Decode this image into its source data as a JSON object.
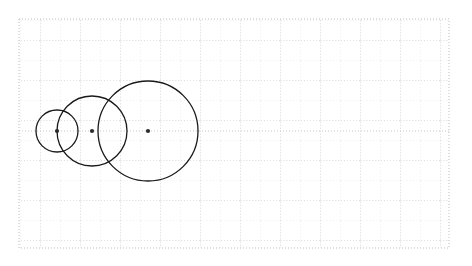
{
  "figure": {
    "title": "Three mutually tangent circles on a dotted grid",
    "width": 472,
    "height": 266,
    "background_color": "#ffffff"
  },
  "grid": {
    "x": 19,
    "y": 19,
    "width": 430,
    "height": 229,
    "minor_spacing": 20,
    "major_spacing": 40,
    "minor_color": "#e3e3e3",
    "major_color": "#c9c9c9",
    "border_color": "#bdbdbd",
    "style": "dotted",
    "columns": 21,
    "rows": 11
  },
  "axis": {
    "baseline_y": 131,
    "baseline_color": "#c9c9c9",
    "baseline_style": "dotted"
  },
  "chart_data": {
    "type": "scatter",
    "title": "Three mutually tangent circles on a dotted grid",
    "xlabel": "",
    "ylabel": "",
    "xlim": [
      19,
      449
    ],
    "ylim": [
      19,
      248
    ],
    "grid": true,
    "legend": "none",
    "stroke_color": "#1a1a1a",
    "stroke_width": 1.3,
    "fill": "none",
    "center_dot_color": "#2b2b2b",
    "center_dot_radius": 2.1,
    "circles": [
      {
        "name": "small-circle",
        "cx": 57,
        "cy": 131,
        "r": 21
      },
      {
        "name": "medium-circle",
        "cx": 92,
        "cy": 131,
        "r": 35
      },
      {
        "name": "large-circle",
        "cx": 148,
        "cy": 131,
        "r": 50
      }
    ],
    "centers": [
      {
        "name": "small-circle-center",
        "x": 57,
        "y": 131
      },
      {
        "name": "medium-circle-center",
        "x": 92,
        "y": 131
      },
      {
        "name": "large-circle-center",
        "x": 148,
        "y": 131
      }
    ]
  }
}
